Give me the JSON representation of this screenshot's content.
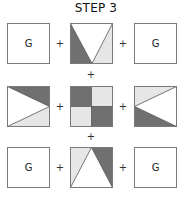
{
  "title": "STEP 3",
  "colors": {
    "dark": "#707070",
    "light": "#e6e6e6",
    "white": "#ffffff",
    "border": "#7a7a7a"
  },
  "plus_symbol": "+",
  "grid": {
    "rows": [
      {
        "tiles": [
          {
            "type": "label",
            "label": "G"
          },
          {
            "type": "pattern",
            "pattern": "v-down",
            "description": "white V from top corners to bottom center; left triangle dark, right triangle light"
          },
          {
            "type": "label",
            "label": "G"
          }
        ]
      },
      {
        "tiles": [
          {
            "type": "pattern",
            "pattern": "v-right",
            "description": "white triangle pointing right; top triangle dark, bottom triangle light"
          },
          {
            "type": "pattern",
            "pattern": "checker",
            "description": "2x2 checker: top-left dark, top-right light, bottom-left light, bottom-right dark"
          },
          {
            "type": "pattern",
            "pattern": "v-left",
            "description": "white triangle pointing left; top triangle light, bottom triangle dark"
          }
        ]
      },
      {
        "tiles": [
          {
            "type": "label",
            "label": "G"
          },
          {
            "type": "pattern",
            "pattern": "v-up",
            "description": "white triangle pointing up; left triangle light, right triangle dark"
          },
          {
            "type": "label",
            "label": "G"
          }
        ]
      }
    ]
  }
}
